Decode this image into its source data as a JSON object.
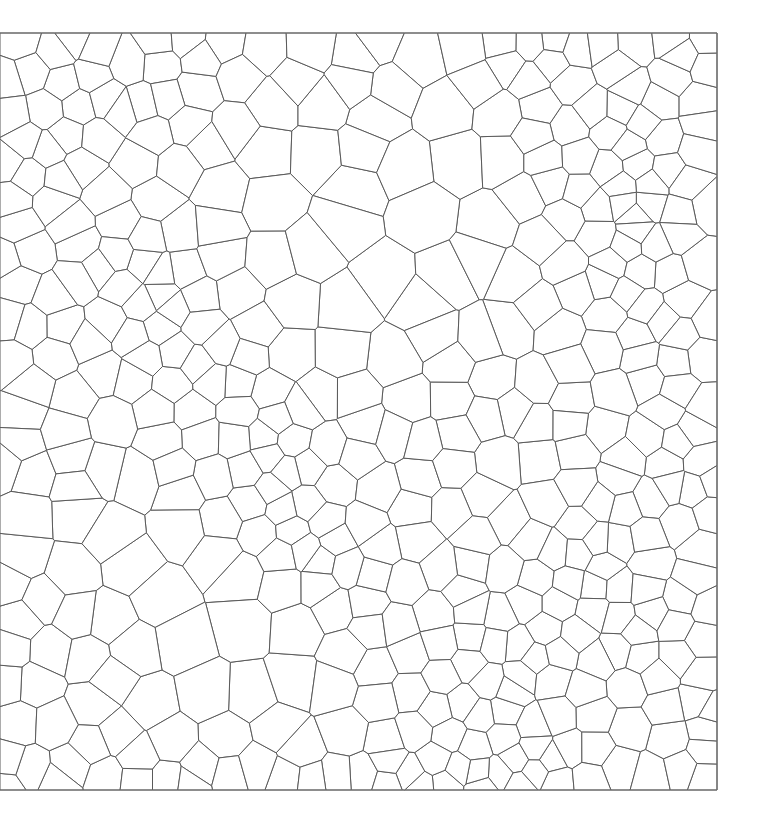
{
  "diagram": {
    "type": "voronoi-tessellation",
    "background": "#ffffff",
    "edge_color": "#5a5a5a",
    "frame_color": "#6e6e6e",
    "bounds": {
      "x0": 0,
      "y0": 33,
      "x1": 717,
      "y1": 790
    },
    "frame_edges": [
      "top",
      "right",
      "bottom"
    ],
    "seed_generation": {
      "count": 470,
      "rng_seed": 1337,
      "relax_iterations": 2
    },
    "density_regions": [
      {
        "cx": 380,
        "cy": 200,
        "r": 110,
        "weight": 0.35
      },
      {
        "cx": 170,
        "cy": 610,
        "r": 80,
        "weight": 0.45
      },
      {
        "cx": 410,
        "cy": 330,
        "r": 60,
        "weight": 0.6
      },
      {
        "cx": 190,
        "cy": 310,
        "r": 45,
        "weight": 1.9
      },
      {
        "cx": 610,
        "cy": 255,
        "r": 60,
        "weight": 1.8
      },
      {
        "cx": 300,
        "cy": 450,
        "r": 60,
        "weight": 1.7
      },
      {
        "cx": 480,
        "cy": 710,
        "r": 60,
        "weight": 1.9
      },
      {
        "cx": 70,
        "cy": 340,
        "r": 45,
        "weight": 1.6
      },
      {
        "cx": 640,
        "cy": 160,
        "r": 60,
        "weight": 1.5
      },
      {
        "cx": 30,
        "cy": 200,
        "r": 50,
        "weight": 1.5
      },
      {
        "cx": 620,
        "cy": 620,
        "r": 70,
        "weight": 1.4
      }
    ]
  }
}
